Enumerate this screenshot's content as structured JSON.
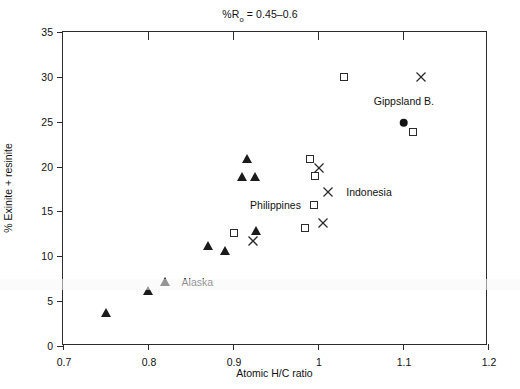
{
  "chart_data": {
    "type": "scatter",
    "title_prefix": "%R",
    "title_subscript": "o",
    "title_suffix": " = 0.45–0.6",
    "xlabel": "Atomic H/C ratio",
    "ylabel": "% Exinite + resinite",
    "xlim": [
      0.7,
      1.2
    ],
    "ylim": [
      0,
      35
    ],
    "xticks": [
      "0.7",
      "0.8",
      "0.9",
      "1",
      "1.1",
      "1.2"
    ],
    "xtick_values": [
      0.7,
      0.8,
      0.9,
      1.0,
      1.1,
      1.2
    ],
    "yticks": [
      "0",
      "5",
      "10",
      "15",
      "20",
      "25",
      "30",
      "35"
    ],
    "ytick_values": [
      0,
      5,
      10,
      15,
      20,
      25,
      30,
      35
    ],
    "grid": false,
    "legend_position": "inline-annotations",
    "series": [
      {
        "name": "Alaska",
        "marker": "filled-triangle",
        "color": "#1b1b1b",
        "points": [
          {
            "x": 0.75,
            "y": 3.7
          },
          {
            "x": 0.8,
            "y": 6.1
          },
          {
            "x": 0.82,
            "y": 7.1
          },
          {
            "x": 0.87,
            "y": 11.1
          },
          {
            "x": 0.89,
            "y": 10.6
          },
          {
            "x": 0.91,
            "y": 18.8
          },
          {
            "x": 0.917,
            "y": 20.8
          },
          {
            "x": 0.926,
            "y": 18.8
          },
          {
            "x": 0.927,
            "y": 12.8
          }
        ]
      },
      {
        "name": "Philippines",
        "marker": "open-square",
        "color": "#2b2b2b",
        "points": [
          {
            "x": 0.901,
            "y": 12.6
          },
          {
            "x": 0.985,
            "y": 13.2
          },
          {
            "x": 0.995,
            "y": 15.7
          },
          {
            "x": 0.996,
            "y": 18.9
          },
          {
            "x": 0.991,
            "y": 20.8
          },
          {
            "x": 1.03,
            "y": 30.0
          },
          {
            "x": 1.112,
            "y": 23.8
          }
        ]
      },
      {
        "name": "Indonesia",
        "marker": "cross",
        "color": "#2b2b2b",
        "points": [
          {
            "x": 0.923,
            "y": 11.7
          },
          {
            "x": 1.006,
            "y": 13.7
          },
          {
            "x": 1.012,
            "y": 17.2
          },
          {
            "x": 1.001,
            "y": 19.8
          },
          {
            "x": 1.121,
            "y": 30.0
          }
        ]
      },
      {
        "name": "Gippsland B.",
        "marker": "filled-circle",
        "color": "#141414",
        "points": [
          {
            "x": 1.101,
            "y": 24.9
          }
        ]
      }
    ],
    "annotations": [
      {
        "label": "Alaska",
        "x": 0.858,
        "y": 7.1,
        "marker": "filled-triangle"
      },
      {
        "label": "Philippines",
        "x": 0.95,
        "y": 15.7,
        "marker": "open-square"
      },
      {
        "label": "Indonesia",
        "x": 1.06,
        "y": 17.2,
        "marker": "cross"
      },
      {
        "label": "Gippsland B.",
        "x": 1.101,
        "y": 27.3,
        "marker": "filled-circle"
      }
    ]
  }
}
